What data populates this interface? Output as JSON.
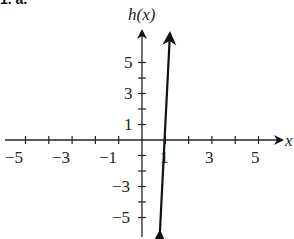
{
  "problem_label": "1. a.",
  "chart_data": {
    "type": "line",
    "title": "",
    "xlabel": "x",
    "ylabel": "h(x)",
    "xlim": [
      -5.8,
      5.8
    ],
    "ylim": [
      -6.2,
      7.0
    ],
    "x_ticks": [
      -5,
      -4,
      -3,
      -2,
      -1,
      1,
      2,
      3,
      4,
      5
    ],
    "x_tick_labels": [
      "-5",
      "-3",
      "-1",
      "1",
      "3",
      "5"
    ],
    "x_tick_label_values": [
      -5,
      -3,
      -1,
      1,
      3,
      5
    ],
    "y_ticks": [
      -5,
      -4,
      -3,
      -2,
      -1,
      1,
      2,
      3,
      4,
      5
    ],
    "y_tick_labels": [
      "5",
      "3",
      "1",
      "-3",
      "-5"
    ],
    "y_tick_label_values": [
      5,
      3,
      1,
      -3,
      -5
    ],
    "grid": false,
    "series": [
      {
        "name": "h(x)",
        "x": [
          0.77,
          1.2
        ],
        "y": [
          -5.9,
          6.9
        ],
        "arrows_both_ends": true
      }
    ],
    "x_intercept": 1.1
  },
  "labels": {
    "y_axis": "h(x)",
    "x_axis": "x",
    "x_ticks": [
      "−5",
      "−3",
      "−1",
      "1",
      "3",
      "5"
    ],
    "y_ticks_pos": [
      "5",
      "3",
      "1"
    ],
    "y_ticks_neg": [
      "−3",
      "−5"
    ]
  }
}
